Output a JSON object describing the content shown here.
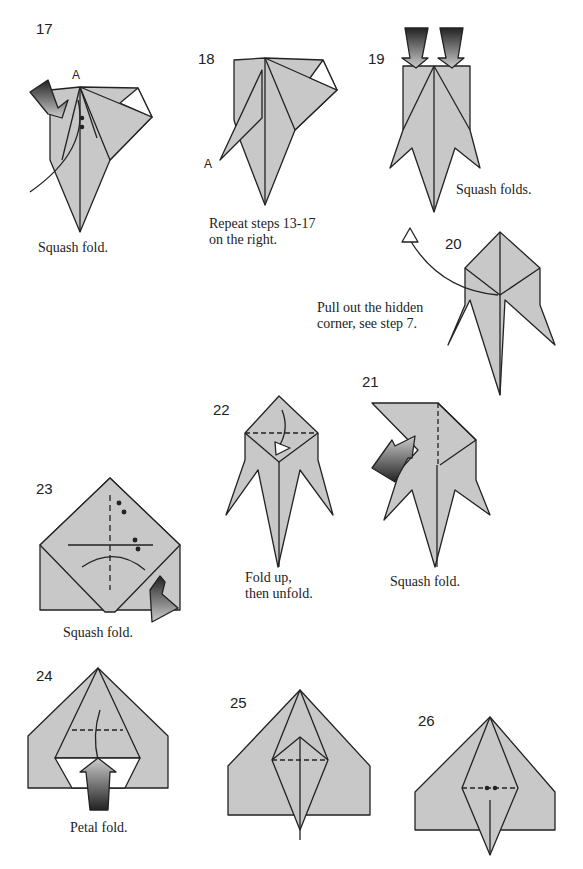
{
  "paper_color": "#c8c8c8",
  "line_color": "#222222",
  "steps": [
    {
      "num": "17",
      "caption": "Squash fold.",
      "point_label": "A"
    },
    {
      "num": "18",
      "caption_line1": "Repeat steps 13-17",
      "caption_line2": "on the right.",
      "point_label": "A"
    },
    {
      "num": "19",
      "caption": "Squash folds."
    },
    {
      "num": "20",
      "caption_line1": "Pull out the hidden",
      "caption_line2": "corner, see step 7."
    },
    {
      "num": "21",
      "caption": "Squash fold."
    },
    {
      "num": "22",
      "caption_line1": "Fold up,",
      "caption_line2": "then unfold."
    },
    {
      "num": "23",
      "caption": "Squash fold."
    },
    {
      "num": "24",
      "caption": "Petal fold."
    },
    {
      "num": "25"
    },
    {
      "num": "26"
    }
  ]
}
